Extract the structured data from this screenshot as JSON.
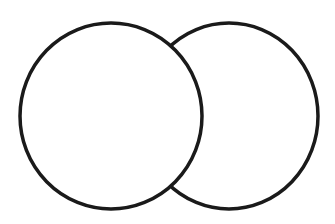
{
  "diagram": {
    "type": "overlapping-circles",
    "background": "#ffffff",
    "stroke_color": "#1a1a1a",
    "stroke_width": 3.5,
    "shapes": [
      {
        "name": "left-circle",
        "cx": 111,
        "cy": 116,
        "rx": 91,
        "ry": 93,
        "layer": "front"
      },
      {
        "name": "right-circle",
        "cx": 229,
        "cy": 116,
        "rx": 89,
        "ry": 93,
        "layer": "back"
      }
    ]
  }
}
